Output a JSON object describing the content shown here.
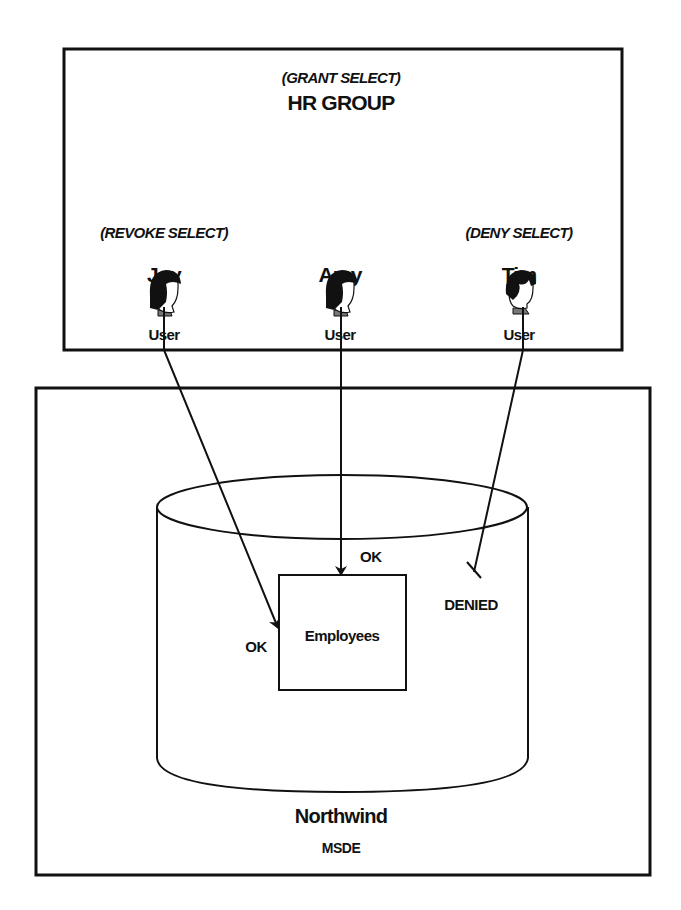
{
  "group": {
    "permission": "(GRANT SELECT)",
    "name": "HR GROUP"
  },
  "users": [
    {
      "name": "Joy",
      "permission": "(REVOKE SELECT)",
      "role": "User",
      "icon": "user-female-icon",
      "result": "OK"
    },
    {
      "name": "Amy",
      "permission": "",
      "role": "User",
      "icon": "user-female-icon",
      "result": "OK"
    },
    {
      "name": "Tim",
      "permission": "(DENY SELECT)",
      "role": "User",
      "icon": "user-male-icon",
      "result": "DENIED"
    }
  ],
  "database": {
    "name": "Northwind",
    "engine": "MSDE",
    "table": "Employees"
  },
  "colors": {
    "ink": "#111111",
    "background": "#ffffff",
    "collar": "#777777"
  }
}
